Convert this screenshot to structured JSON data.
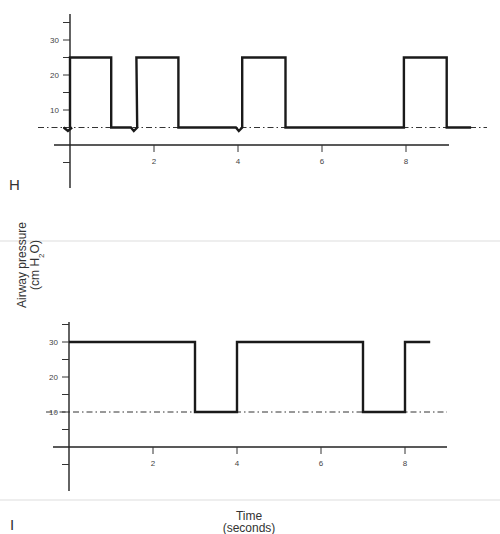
{
  "figure": {
    "y_axis_title_line1": "Airway pressure",
    "y_axis_title_line2_prefix": "(cm H",
    "y_axis_title_line2_sub": "2",
    "y_axis_title_line2_suffix": "O)",
    "x_axis_title_line1": "Time",
    "x_axis_title_line2": "(seconds)"
  },
  "chart_data": [
    {
      "type": "line",
      "panel_label": "H",
      "title": "",
      "xlabel": "Time (seconds)",
      "ylabel": "Airway pressure (cm H2O)",
      "xlim": [
        0,
        9.6
      ],
      "ylim": [
        -10,
        37
      ],
      "x_ticks": [
        2,
        4,
        6,
        8
      ],
      "y_ticks": [
        -5,
        5,
        10,
        15,
        20,
        25,
        30,
        35
      ],
      "y_tick_labels": {
        "10": "10",
        "20": "20",
        "30": "30"
      },
      "grid": false,
      "reference_line": {
        "y": 5,
        "style": "dash-dot",
        "label": "PEEP"
      },
      "series": [
        {
          "name": "Airway pressure",
          "points": [
            [
              0,
              5
            ],
            [
              0,
              25
            ],
            [
              0.98,
              25
            ],
            [
              0.98,
              5
            ],
            [
              1.45,
              5
            ],
            [
              1.52,
              4
            ],
            [
              1.6,
              5
            ],
            [
              1.58,
              25
            ],
            [
              2.58,
              25
            ],
            [
              2.58,
              5
            ],
            [
              3.95,
              5
            ],
            [
              4.02,
              4
            ],
            [
              4.1,
              5
            ],
            [
              4.1,
              25
            ],
            [
              5.13,
              25
            ],
            [
              5.13,
              5
            ],
            [
              7.95,
              5
            ],
            [
              7.95,
              25
            ],
            [
              8.97,
              25
            ],
            [
              8.97,
              5
            ],
            [
              9.55,
              5
            ]
          ],
          "pre_dip": [
            [
              -0.15,
              5
            ],
            [
              -0.05,
              4
            ],
            [
              0.05,
              5
            ]
          ],
          "description": "Square-wave breaths at 25 cm H2O with PEEP 5; patient-triggered dips before breaths at ~1.5 s and ~4 s"
        }
      ]
    },
    {
      "type": "line",
      "panel_label": "I",
      "title": "",
      "xlabel": "Time (seconds)",
      "ylabel": "Airway pressure (cm H2O)",
      "xlim": [
        0,
        9.3
      ],
      "ylim": [
        -10,
        37
      ],
      "x_ticks": [
        2,
        4,
        6,
        8
      ],
      "y_ticks": [
        -5,
        5,
        10,
        15,
        20,
        25,
        30,
        35
      ],
      "y_tick_labels": {
        "10": "10",
        "20": "20",
        "30": "30"
      },
      "grid": false,
      "reference_line": {
        "y": 10,
        "style": "dash-dot"
      },
      "series": [
        {
          "name": "Airway pressure",
          "points": [
            [
              0,
              30
            ],
            [
              3.0,
              30
            ],
            [
              3.0,
              10
            ],
            [
              4.0,
              10
            ],
            [
              4.0,
              30
            ],
            [
              7.0,
              30
            ],
            [
              7.0,
              10
            ],
            [
              8.0,
              10
            ],
            [
              8.0,
              30
            ],
            [
              8.6,
              30
            ]
          ],
          "description": "Pressure alternating between 30 cm H2O (3 s) and 10 cm H2O (1 s)"
        }
      ]
    }
  ]
}
